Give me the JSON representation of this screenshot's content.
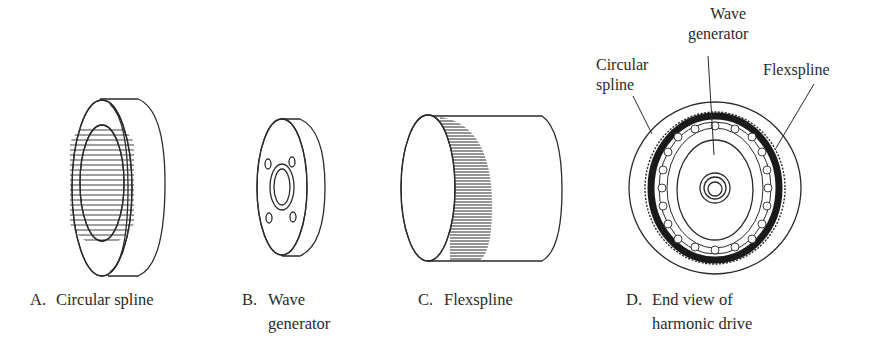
{
  "figure": {
    "panels": [
      {
        "id": "A",
        "letter": "A.",
        "caption_line1": "Circular spline",
        "caption_line2": ""
      },
      {
        "id": "B",
        "letter": "B.",
        "caption_line1": "Wave",
        "caption_line2": "generator"
      },
      {
        "id": "C",
        "letter": "C.",
        "caption_line1": "Flexspline",
        "caption_line2": ""
      },
      {
        "id": "D",
        "letter": "D.",
        "caption_line1": "End view of",
        "caption_line2": "harmonic drive"
      }
    ],
    "callouts": {
      "wave_generator_line1": "Wave",
      "wave_generator_line2": "generator",
      "circular_spline_line1": "Circular",
      "circular_spline_line2": "spline",
      "flexspline": "Flexspline"
    },
    "colors": {
      "ink": "#2a2a2a",
      "background": "#ffffff"
    }
  }
}
